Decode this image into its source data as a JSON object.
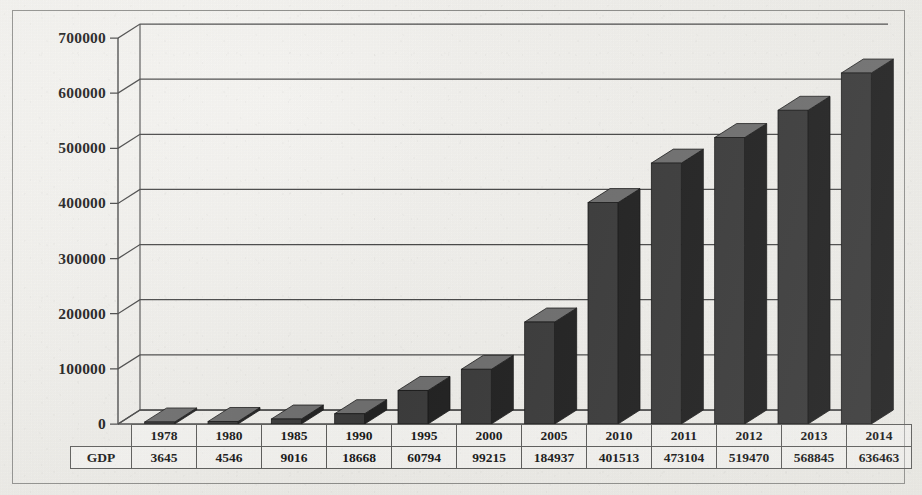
{
  "chart_data": {
    "type": "bar",
    "title": "",
    "xlabel": "",
    "ylabel": "",
    "categories": [
      "1978",
      "1980",
      "1985",
      "1990",
      "1995",
      "2000",
      "2005",
      "2010",
      "2011",
      "2012",
      "2013",
      "2014"
    ],
    "series": [
      {
        "name": "GDP",
        "values": [
          3645,
          4546,
          9016,
          18668,
          60794,
          99215,
          184937,
          401513,
          473104,
          519470,
          568845,
          636463
        ]
      }
    ],
    "ylim": [
      0,
      700000
    ],
    "yticks": [
      0,
      100000,
      200000,
      300000,
      400000,
      500000,
      600000,
      700000
    ],
    "ytick_labels": [
      "0",
      "100000",
      "200000",
      "300000",
      "400000",
      "500000",
      "600000",
      "700000"
    ],
    "grid": true,
    "legend": "none",
    "style": "3d-column",
    "colors": {
      "bar_front": "#3a3a3a",
      "bar_top": "#6e6e6e",
      "bar_side": "#242424",
      "gridline": "#4a4a4a",
      "axis": "#4a4a4a",
      "frame": "#8d8d8a",
      "background": "#efeeea",
      "text": "#1d1d1d"
    }
  },
  "table": {
    "row_label": "GDP",
    "header_row": [
      "1978",
      "1980",
      "1985",
      "1990",
      "1995",
      "2000",
      "2005",
      "2010",
      "2011",
      "2012",
      "2013",
      "2014"
    ],
    "value_row": [
      "3645",
      "4546",
      "9016",
      "18668",
      "60794",
      "99215",
      "184937",
      "401513",
      "473104",
      "519470",
      "568845",
      "636463"
    ]
  }
}
